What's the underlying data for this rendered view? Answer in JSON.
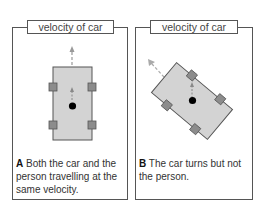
{
  "panels": [
    {
      "id": "A",
      "label": "velocity of car",
      "letter": "A",
      "caption": "Both the car and the person travelling at the same velocity."
    },
    {
      "id": "B",
      "label": "velocity of car",
      "letter": "B",
      "caption": "The car turns but not the person."
    }
  ],
  "colors": {
    "car_fill": "#d3d3d3",
    "wheel_fill": "#8c8c8c",
    "outline": "#555555",
    "arrow": "#888888",
    "person": "#000000"
  }
}
